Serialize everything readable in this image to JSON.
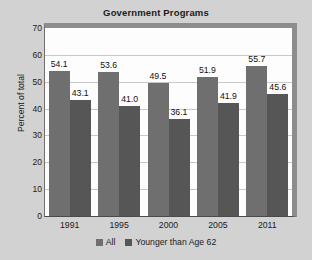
{
  "chart_data": {
    "type": "bar",
    "title": "Government Programs",
    "xlabel": "",
    "ylabel": "Percent of total",
    "categories": [
      "1991",
      "1995",
      "2000",
      "2005",
      "2011"
    ],
    "ylim": [
      0,
      70
    ],
    "yticks": [
      "0",
      "10",
      "20",
      "30",
      "40",
      "50",
      "60",
      "70"
    ],
    "grid": true,
    "legend_position": "bottom",
    "series": [
      {
        "name": "All",
        "color": "#6f6f6f",
        "values": [
          54.1,
          53.6,
          49.5,
          51.9,
          55.7
        ],
        "labels": [
          "54.1",
          "53.6",
          "49.5",
          "51.9",
          "55.7"
        ]
      },
      {
        "name": "Younger than Age 62",
        "color": "#565656",
        "values": [
          43.1,
          41.0,
          36.1,
          41.9,
          45.6
        ],
        "labels": [
          "43.1",
          "41.0",
          "36.1",
          "41.9",
          "45.6"
        ]
      }
    ]
  },
  "style": {
    "background": "#d2d2d2",
    "plot_background": "#fdfdfd",
    "grid_color": "#c8c8c8",
    "text_color": "#1b1b1b"
  }
}
